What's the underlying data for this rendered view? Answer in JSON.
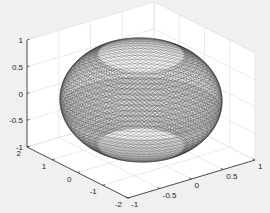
{
  "chart_data": {
    "type": "surface3d",
    "title": "",
    "surface": {
      "shape": "ellipsoid",
      "center": [
        0,
        0,
        0
      ],
      "radii": {
        "x": 1,
        "y": 2,
        "z": 1
      },
      "z_visible_range": [
        -0.85,
        0.85
      ],
      "edge_color": "#3c3c3c",
      "face_color": "#ffffff"
    },
    "axes": {
      "x": {
        "label": "",
        "lim": [
          -1,
          1
        ],
        "ticks": [
          -1,
          -0.5,
          0,
          0.5,
          1
        ],
        "tick_labels": [
          "-1",
          "-0.5",
          "0",
          "0.5",
          "1"
        ]
      },
      "y": {
        "label": "",
        "lim": [
          -2,
          2
        ],
        "ticks": [
          2,
          1,
          0,
          -1,
          -2
        ],
        "tick_labels": [
          "2",
          "1",
          "0",
          "-1",
          "-2"
        ]
      },
      "z": {
        "label": "",
        "lim": [
          -1,
          1
        ],
        "ticks": [
          1,
          0.5,
          0,
          -0.5,
          -1
        ],
        "tick_labels": [
          "1",
          "0.5",
          "0",
          "-0.5",
          "-1"
        ]
      }
    },
    "grid": true,
    "box": false,
    "legend": null,
    "colors": {
      "figure_background": "#f0f0f0",
      "axes_background": "#ffffff",
      "grid": "#dedede",
      "axis_line": "#262626",
      "mesh": "#3c3c3c"
    }
  }
}
